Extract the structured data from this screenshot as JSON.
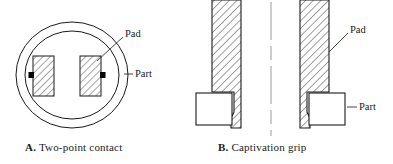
{
  "figure": {
    "background_color": "#ffffff",
    "line_color": "#1a1a1a",
    "hatch_color": "#3a3a3a",
    "contact_marker_color": "#000000",
    "panels": [
      {
        "id": "panel-a",
        "caption_letter": "A.",
        "caption_text": "Two-point contact",
        "annotations": [
          {
            "name": "pad",
            "label": "Pad"
          },
          {
            "name": "part",
            "label": "Part"
          }
        ],
        "elements": [
          {
            "name": "outer-circle",
            "kind": "circle"
          },
          {
            "name": "inner-circle",
            "kind": "circle"
          },
          {
            "name": "pad-left",
            "kind": "hatched-rect"
          },
          {
            "name": "pad-right",
            "kind": "hatched-rect"
          },
          {
            "name": "contact-point-left",
            "kind": "square-marker"
          },
          {
            "name": "contact-point-right",
            "kind": "square-marker"
          }
        ]
      },
      {
        "id": "panel-b",
        "caption_letter": "B.",
        "caption_text": "Captivation grip",
        "annotations": [
          {
            "name": "pad",
            "label": "Pad"
          },
          {
            "name": "part",
            "label": "Part"
          }
        ],
        "elements": [
          {
            "name": "jaw-left",
            "kind": "hatched-profile"
          },
          {
            "name": "jaw-right",
            "kind": "hatched-profile"
          },
          {
            "name": "part-left",
            "kind": "rect"
          },
          {
            "name": "part-right",
            "kind": "rect"
          },
          {
            "name": "centerline",
            "kind": "dashed-line"
          }
        ]
      }
    ]
  }
}
